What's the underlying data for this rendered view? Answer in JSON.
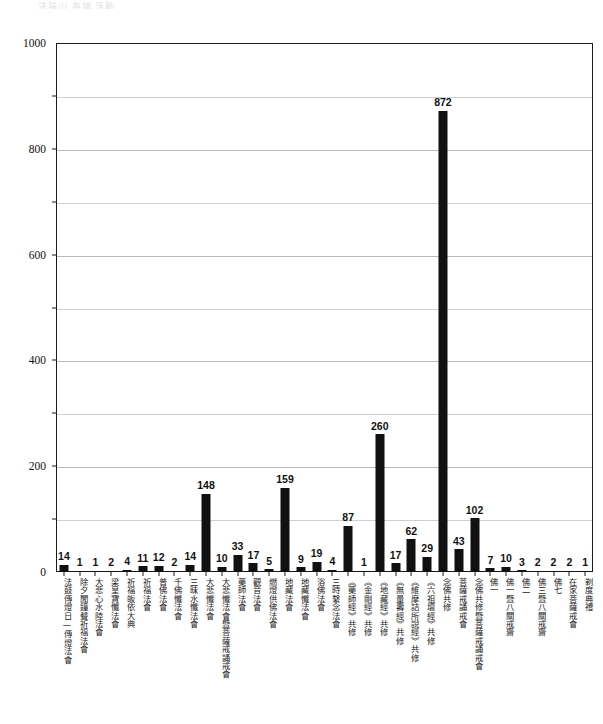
{
  "header": {
    "faint_cropped_text": "法鼓山  各項  活動"
  },
  "chart_data": {
    "type": "bar",
    "title": "",
    "subtitle": "",
    "xlabel": "",
    "ylabel": "",
    "ylim": [
      0,
      1000
    ],
    "yticks": [
      0,
      200,
      400,
      600,
      800,
      1000
    ],
    "ytick_labels": [
      "0",
      "200",
      "400",
      "600",
      "800",
      "1000"
    ],
    "minor_gridlines": [
      100,
      300,
      500,
      700,
      900
    ],
    "grid": true,
    "legend": "none",
    "bar_color": "#111111",
    "show_data_labels": true,
    "categories": [
      "法鼓傳燈日—傳燈法會",
      "除夕聞鐘聲祈福法會",
      "大悲心水陸法會",
      "梁皇寶懺法會",
      "祈福皈依大典",
      "祈福法會",
      "普佛法會",
      "千佛懺法會",
      "三昧水懺法會",
      "大悲懺法會",
      "大悲懺法會暨菩薩戒誦戒會",
      "藥師法會",
      "觀音法會",
      "燃燈供佛法會",
      "地藏法會",
      "地藏懺法會",
      "浴佛法會",
      "三時繫念法會",
      "《藥師經》共修",
      "《金剛經》共修",
      "《地藏經》共修",
      "《無量壽經》共修",
      "《維摩詰所說經》共修",
      "《六祖壇經》共修",
      "念佛共修",
      "菩薩戒誦戒會",
      "念佛共修暨菩薩戒誦戒會",
      "佛一",
      "佛一暨八關戒齋",
      "佛二",
      "佛三暨八關戒齋",
      "佛七",
      "在家菩薩戒會",
      "剃度典禮"
    ],
    "values": [
      14,
      1,
      1,
      2,
      4,
      11,
      12,
      2,
      14,
      148,
      10,
      33,
      17,
      5,
      159,
      9,
      19,
      4,
      87,
      1,
      260,
      17,
      62,
      29,
      872,
      43,
      102,
      7,
      10,
      3,
      2,
      2,
      2,
      1
    ],
    "value_labels": [
      "14",
      "1",
      "1",
      "2",
      "4",
      "11",
      "12",
      "2",
      "14",
      "148",
      "10",
      "33",
      "17",
      "5",
      "159",
      "9",
      "19",
      "4",
      "87",
      "1",
      "260",
      "17",
      "62",
      "29",
      "872",
      "43",
      "102",
      "7",
      "10",
      "3",
      "2",
      "2",
      "2",
      "1"
    ]
  }
}
